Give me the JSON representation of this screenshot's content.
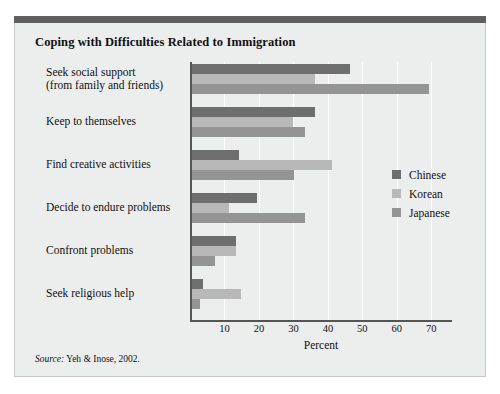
{
  "figure": {
    "title": "Coping with Difficulties Related to Immigration",
    "source_label": "Source:",
    "source_text": " Yeh & Inose, 2002."
  },
  "colors": {
    "accent_bar": "#5f5f5f",
    "panel_background": "#eceded",
    "panel_border": "#c9c9c9",
    "axis": "#555555",
    "gridline": "#ffffff",
    "chinese": "#6e6e6e",
    "korean": "#b8b8b8",
    "japanese": "#949494"
  },
  "chart_data": {
    "type": "bar",
    "orientation": "horizontal",
    "title": "Coping with Difficulties Related to Immigration",
    "xlabel": "Percent",
    "ylabel": "",
    "xlim": [
      0,
      76
    ],
    "xticks": [
      10,
      20,
      30,
      40,
      50,
      60,
      70
    ],
    "xtick_labels": [
      "10",
      "20",
      "30",
      "40",
      "50",
      "60",
      "70"
    ],
    "grid": true,
    "legend_position": "inside-right",
    "categories": [
      "Seek social support\n(from family and friends)",
      "Keep to themselves",
      "Find creative activities",
      "Decide to endure problems",
      "Confront problems",
      "Seek religious help"
    ],
    "category_lines": [
      [
        "Seek social support",
        "(from family and friends)"
      ],
      [
        "Keep to themselves"
      ],
      [
        "Find creative activities"
      ],
      [
        "Decide to endure problems"
      ],
      [
        "Confront problems"
      ],
      [
        "Seek religious help"
      ]
    ],
    "series": [
      {
        "name": "Chinese",
        "color": "#6e6e6e",
        "values": [
          46,
          36,
          14,
          19,
          13,
          3.5
        ]
      },
      {
        "name": "Korean",
        "color": "#b8b8b8",
        "values": [
          36,
          29.5,
          41,
          11,
          13,
          14.5
        ]
      },
      {
        "name": "Japanese",
        "color": "#949494",
        "values": [
          69,
          33,
          30,
          33,
          7,
          2.5
        ]
      }
    ]
  }
}
